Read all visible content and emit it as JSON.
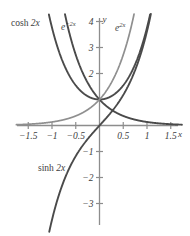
{
  "figure": {
    "axis_label_x": "x",
    "axis_label_y": "y",
    "axis_color": "#8d8d8d",
    "curve_color_dark": "#4a4a4a",
    "curve_color_light": "#8f8f8f",
    "text_color": "#3d3d3d"
  },
  "curve_labels": {
    "cosh": {
      "fn": "cosh",
      "arg": "2x"
    },
    "eneg": {
      "base": "e",
      "exp": "−2x"
    },
    "epos": {
      "base": "e",
      "exp": "2x"
    },
    "sinh": {
      "fn": "sinh",
      "arg": "2x"
    }
  },
  "ticks": {
    "x": [
      "−1.5",
      "−1",
      "−0.5",
      "0.5",
      "1",
      "1.5"
    ],
    "y": [
      "4",
      "3",
      "2",
      "−1",
      "−2",
      "−3"
    ]
  },
  "chart_data": {
    "type": "line",
    "title": "",
    "xlabel": "x",
    "ylabel": "y",
    "xlim": [
      -1.75,
      1.75
    ],
    "ylim": [
      -3.6,
      4.9
    ],
    "grid": false,
    "legend": "inline-annotations",
    "xticks": [
      -1.5,
      -1,
      -0.5,
      0.5,
      1,
      1.5
    ],
    "yticks": [
      4,
      3,
      2,
      -1,
      -2,
      -3
    ],
    "annotations": [
      {
        "text": "cosh 2x",
        "x": -1.45,
        "y": 4.55
      },
      {
        "text": "e^{-2x}",
        "x": -0.72,
        "y": 4.62
      },
      {
        "text": "e^{2x}",
        "x": 0.42,
        "y": 4.6
      },
      {
        "text": "sinh 2x",
        "x": -0.95,
        "y": -1.72
      }
    ],
    "series": [
      {
        "name": "cosh 2x",
        "color": "#4a4a4a",
        "expression": "cosh(2x)",
        "x": [
          -1.2,
          -1.1,
          -1.0,
          -0.9,
          -0.8,
          -0.7,
          -0.6,
          -0.5,
          -0.4,
          -0.3,
          -0.2,
          -0.1,
          0,
          0.1,
          0.2,
          0.3,
          0.4,
          0.5,
          0.6,
          0.7,
          0.8,
          0.9,
          1.0,
          1.1,
          1.2
        ],
        "y": [
          5.557,
          4.568,
          3.762,
          3.107,
          2.577,
          2.15,
          1.811,
          1.543,
          1.337,
          1.185,
          1.081,
          1.02,
          1.0,
          1.02,
          1.081,
          1.185,
          1.337,
          1.543,
          1.811,
          2.15,
          2.577,
          3.107,
          3.762,
          4.568,
          5.557
        ]
      },
      {
        "name": "e^{-2x}",
        "color": "#4a4a4a",
        "expression": "exp(-2x)",
        "x": [
          -0.85,
          -0.75,
          -0.65,
          -0.55,
          -0.45,
          -0.35,
          -0.25,
          -0.15,
          -0.05,
          0,
          0.25,
          0.5,
          0.75,
          1.0,
          1.25,
          1.5,
          1.75
        ],
        "y": [
          5.474,
          4.482,
          3.669,
          3.004,
          2.46,
          2.014,
          1.649,
          1.35,
          1.105,
          1.0,
          0.607,
          0.368,
          0.223,
          0.135,
          0.082,
          0.05,
          0.03
        ]
      },
      {
        "name": "e^{2x}",
        "color": "#8f8f8f",
        "expression": "exp(2x)",
        "x": [
          -1.75,
          -1.5,
          -1.25,
          -1.0,
          -0.75,
          -0.5,
          -0.25,
          0,
          0.05,
          0.15,
          0.25,
          0.35,
          0.45,
          0.55,
          0.65,
          0.75,
          0.85
        ],
        "y": [
          0.03,
          0.05,
          0.082,
          0.135,
          0.223,
          0.368,
          0.607,
          1.0,
          1.105,
          1.35,
          1.649,
          2.014,
          2.46,
          3.004,
          3.669,
          4.482,
          5.474
        ]
      },
      {
        "name": "sinh 2x",
        "color": "#4a4a4a",
        "expression": "sinh(2x)",
        "x": [
          -1.0,
          -0.9,
          -0.8,
          -0.7,
          -0.6,
          -0.5,
          -0.4,
          -0.3,
          -0.2,
          -0.1,
          0,
          0.1,
          0.2,
          0.3,
          0.4,
          0.5,
          0.6,
          0.7,
          0.8,
          0.9,
          1.0
        ],
        "y": [
          -3.627,
          -2.942,
          -2.376,
          -1.904,
          -1.509,
          -1.175,
          -0.888,
          -0.637,
          -0.411,
          -0.201,
          0,
          0.201,
          0.411,
          0.637,
          0.888,
          1.175,
          1.509,
          1.904,
          2.376,
          2.942,
          3.627
        ]
      }
    ]
  }
}
